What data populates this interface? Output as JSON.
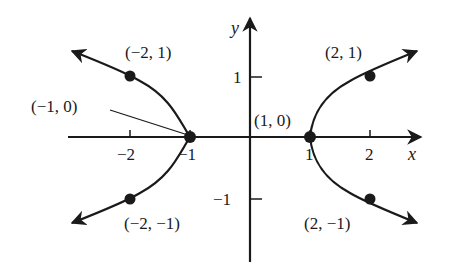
{
  "diagram": {
    "type": "coordinate-graph",
    "colors": {
      "ink": "#1a1a1a",
      "background": "#ffffff"
    },
    "axes": {
      "x_label": "x",
      "y_label": "y",
      "x_ticks": [
        {
          "value": -2,
          "label": "−2"
        },
        {
          "value": -1,
          "label": "−1"
        },
        {
          "value": 1,
          "label": "1"
        },
        {
          "value": 2,
          "label": "2"
        }
      ],
      "y_ticks": [
        {
          "value": 1,
          "label": "1"
        },
        {
          "value": -1,
          "label": "−1"
        }
      ]
    },
    "points": [
      {
        "x": -2,
        "y": 1,
        "label": "(−2, 1)"
      },
      {
        "x": -1,
        "y": 0,
        "label": "(−1, 0)"
      },
      {
        "x": -2,
        "y": -1,
        "label": "(−2, −1)"
      },
      {
        "x": 2,
        "y": 1,
        "label": "(2, 1)"
      },
      {
        "x": 1,
        "y": 0,
        "label": "(1, 0)"
      },
      {
        "x": 2,
        "y": -1,
        "label": "(2, −1)"
      }
    ],
    "curves": [
      {
        "name": "right-branch",
        "equation": "x = y^2 + 1"
      },
      {
        "name": "left-branch",
        "equation": "x = -(y^2 + 1)"
      }
    ]
  }
}
